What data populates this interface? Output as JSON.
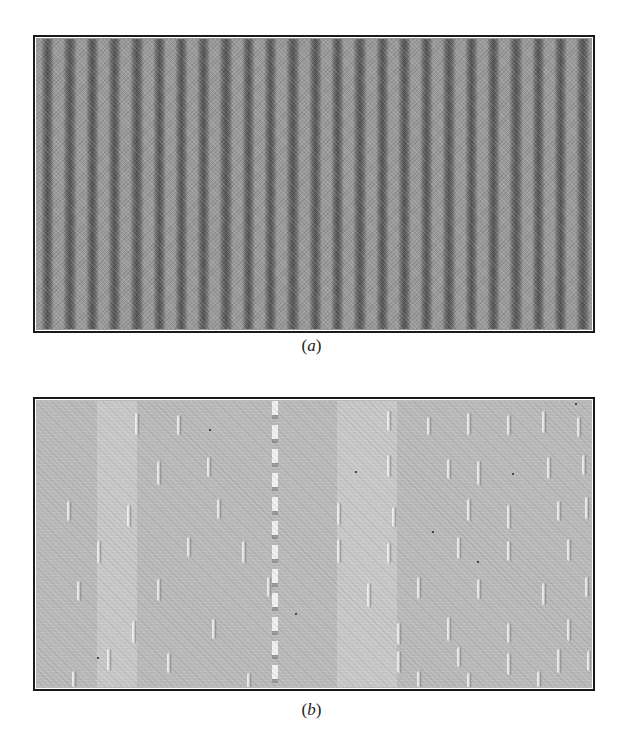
{
  "figure": {
    "panels": [
      {
        "id": "a",
        "caption_letter": "a",
        "description": "woven fabric with regular vertical dark/light stripes",
        "stripe_count": 25,
        "stripe_period_px": 22.3,
        "colors": {
          "base": "#9a9a9a",
          "dark_stripe": "#4a4a4a",
          "light_stripe": "#c8c8c8"
        }
      },
      {
        "id": "b",
        "caption_letter": "b",
        "description": "light fabric with raised vertical ridge marks in rows",
        "colors": {
          "base": "#b9b9b9",
          "ridge_highlight": "#f0f0f0",
          "ridge_shadow": "#6e6e6e"
        }
      }
    ],
    "captions": {
      "a": {
        "open": "(",
        "letter": "a",
        "close": ")"
      },
      "b": {
        "open": "(",
        "letter": "b",
        "close": ")"
      }
    }
  },
  "ridges_b": [
    [
      98,
      12,
      22
    ],
    [
      140,
      14,
      20
    ],
    [
      350,
      10,
      20
    ],
    [
      390,
      16,
      18
    ],
    [
      430,
      12,
      22
    ],
    [
      470,
      14,
      20
    ],
    [
      505,
      10,
      22
    ],
    [
      540,
      16,
      20
    ],
    [
      120,
      60,
      24
    ],
    [
      170,
      56,
      20
    ],
    [
      350,
      54,
      22
    ],
    [
      410,
      58,
      20
    ],
    [
      440,
      60,
      24
    ],
    [
      510,
      56,
      22
    ],
    [
      545,
      54,
      20
    ],
    [
      30,
      100,
      20
    ],
    [
      90,
      104,
      22
    ],
    [
      180,
      98,
      20
    ],
    [
      300,
      102,
      22
    ],
    [
      355,
      106,
      20
    ],
    [
      430,
      98,
      22
    ],
    [
      470,
      104,
      24
    ],
    [
      520,
      100,
      20
    ],
    [
      548,
      96,
      22
    ],
    [
      60,
      140,
      22
    ],
    [
      150,
      136,
      20
    ],
    [
      205,
      140,
      22
    ],
    [
      300,
      138,
      24
    ],
    [
      350,
      142,
      20
    ],
    [
      420,
      136,
      22
    ],
    [
      470,
      140,
      20
    ],
    [
      530,
      138,
      22
    ],
    [
      40,
      180,
      20
    ],
    [
      120,
      178,
      22
    ],
    [
      230,
      176,
      20
    ],
    [
      330,
      182,
      24
    ],
    [
      380,
      176,
      22
    ],
    [
      440,
      178,
      20
    ],
    [
      505,
      182,
      22
    ],
    [
      548,
      176,
      20
    ],
    [
      95,
      220,
      22
    ],
    [
      175,
      218,
      20
    ],
    [
      360,
      222,
      22
    ],
    [
      410,
      216,
      24
    ],
    [
      470,
      222,
      20
    ],
    [
      530,
      218,
      22
    ],
    [
      70,
      248,
      22
    ],
    [
      130,
      252,
      20
    ],
    [
      360,
      250,
      22
    ],
    [
      420,
      246,
      20
    ],
    [
      470,
      252,
      22
    ],
    [
      520,
      248,
      24
    ],
    [
      550,
      250,
      20
    ],
    [
      35,
      270,
      16
    ],
    [
      210,
      272,
      16
    ],
    [
      380,
      270,
      16
    ],
    [
      430,
      272,
      16
    ],
    [
      500,
      270,
      16
    ]
  ],
  "specks_b": [
    [
      172,
      28
    ],
    [
      318,
      70
    ],
    [
      475,
      72
    ],
    [
      395,
      130
    ],
    [
      440,
      160
    ],
    [
      258,
      212
    ],
    [
      60,
      256
    ],
    [
      538,
      2
    ]
  ]
}
